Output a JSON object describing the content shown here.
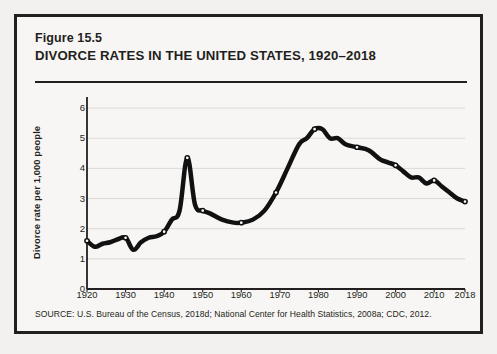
{
  "figure": {
    "number": "Figure 15.5",
    "title": "DIVORCE RATES IN THE UNITED STATES, 1920–2018",
    "source": "SOURCE: U.S. Bureau of the Census, 2018d; National Center for Health Statistics, 2008a; CDC, 2012."
  },
  "colors": {
    "line": "#111111",
    "marker_fill": "#ffffff",
    "axis": "#231f20",
    "grid": "#d8d6d2",
    "page_background": "#f2f1ef",
    "card_background": "#f7f6f4",
    "border": "#231f20"
  },
  "chart_data": {
    "type": "line",
    "title": "DIVORCE RATES IN THE UNITED STATES, 1920–2018",
    "xlabel": "",
    "ylabel": "Divorce rate per 1,000 people",
    "xlim": [
      1920,
      2018
    ],
    "ylim": [
      0,
      6.3
    ],
    "yticks": [
      0,
      1,
      2,
      3,
      4,
      5,
      6
    ],
    "ytick_labels": [
      "0",
      "1",
      "2",
      "3",
      "4",
      "5",
      "6"
    ],
    "xticks": [
      1920,
      1930,
      1940,
      1950,
      1960,
      1970,
      1980,
      1990,
      2000,
      2010,
      2018
    ],
    "xtick_labels": [
      "1920",
      "1930",
      "1940",
      "1950",
      "1960",
      "1970",
      "1980",
      "1990",
      "2000",
      "2010",
      "2018"
    ],
    "grid": "horizontal",
    "legend": null,
    "series": [
      {
        "name": "Divorce rate per 1,000 people",
        "x": [
          1920,
          1922,
          1924,
          1926,
          1928,
          1930,
          1932,
          1934,
          1936,
          1938,
          1940,
          1942,
          1944,
          1946,
          1948,
          1950,
          1952,
          1955,
          1958,
          1960,
          1963,
          1966,
          1969,
          1972,
          1975,
          1977,
          1979,
          1981,
          1983,
          1985,
          1987,
          1990,
          1993,
          1996,
          1998,
          2000,
          2002,
          2004,
          2006,
          2008,
          2010,
          2012,
          2014,
          2016,
          2018
        ],
        "y": [
          1.6,
          1.4,
          1.5,
          1.55,
          1.65,
          1.7,
          1.3,
          1.55,
          1.7,
          1.75,
          1.9,
          2.3,
          2.6,
          4.35,
          2.8,
          2.6,
          2.5,
          2.3,
          2.2,
          2.2,
          2.3,
          2.6,
          3.2,
          4.0,
          4.8,
          5.0,
          5.3,
          5.3,
          5.0,
          5.0,
          4.8,
          4.7,
          4.6,
          4.3,
          4.2,
          4.1,
          3.9,
          3.7,
          3.7,
          3.5,
          3.6,
          3.4,
          3.2,
          3.0,
          2.9
        ],
        "marker_years": [
          1920,
          1930,
          1940,
          1946,
          1950,
          1960,
          1969,
          1979,
          1990,
          2000,
          2010,
          2018
        ],
        "style": "solid",
        "line_width_px": 4.5,
        "marker": "open-circle"
      }
    ]
  }
}
